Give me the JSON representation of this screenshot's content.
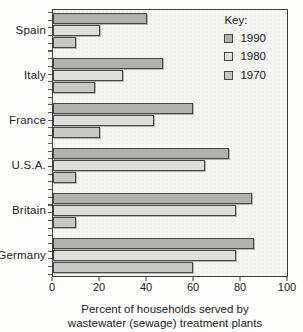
{
  "chart_data": {
    "type": "bar",
    "orientation": "horizontal",
    "categories": [
      "Spain",
      "Italy",
      "France",
      "U.S.A.",
      "Britain",
      "Germany"
    ],
    "series": [
      {
        "name": "1990",
        "color": "#b1b1ae",
        "values": [
          40,
          47,
          60,
          75,
          85,
          86
        ]
      },
      {
        "name": "1980",
        "color": "#dededb",
        "values": [
          20,
          30,
          43,
          65,
          78,
          78
        ]
      },
      {
        "name": "1970",
        "color": "#c7c7c4",
        "values": [
          10,
          18,
          20,
          10,
          10,
          60
        ]
      }
    ],
    "x_ticks": [
      "0",
      "20",
      "40",
      "60",
      "80",
      "100"
    ],
    "xlim": [
      0,
      100
    ],
    "xlabel_line1": "Percent of households served by",
    "xlabel_line2": "wastewater (sewage) treatment plants",
    "legend_title": "Key:",
    "legend_position": "top-right",
    "grid": false
  },
  "colors": {
    "plot_background": "#f5f5f2",
    "plot_border": "#3d3d3d",
    "bar_border": "#474747",
    "text": "#242424"
  }
}
